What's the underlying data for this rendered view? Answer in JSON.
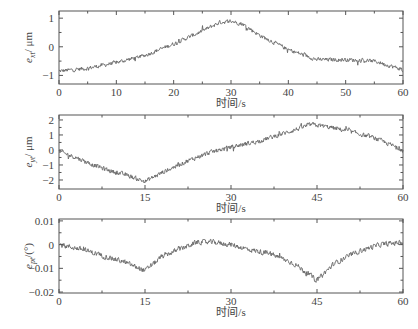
{
  "chart_data": [
    {
      "type": "line",
      "title": "",
      "xlabel": "时间/s",
      "ylabel": "e_xt / μm",
      "xlim": [
        0,
        60
      ],
      "ylim": [
        -1.3,
        1.25
      ],
      "xticks": [
        0,
        10,
        20,
        30,
        40,
        50,
        60
      ],
      "xtick_labels": [
        "0",
        "10",
        "20",
        "30",
        "40",
        "50",
        "60"
      ],
      "yticks": [
        -1,
        0,
        1
      ],
      "ytick_labels": [
        "-1",
        "0",
        "1"
      ],
      "grid": false,
      "legend": null,
      "noise_amplitude": 0.14,
      "series": [
        {
          "name": "e_xt",
          "x": [
            0,
            5,
            10,
            15,
            20,
            25,
            28,
            30,
            32,
            35,
            40,
            45,
            50,
            55,
            60
          ],
          "values": [
            -0.85,
            -0.75,
            -0.55,
            -0.3,
            0.1,
            0.55,
            0.85,
            0.9,
            0.8,
            0.4,
            -0.1,
            -0.45,
            -0.45,
            -0.5,
            -0.8
          ]
        }
      ]
    },
    {
      "type": "line",
      "title": "",
      "xlabel": "",
      "ylabel": "e_yt / μm",
      "xlim": [
        0,
        60
      ],
      "ylim": [
        -2.6,
        2.33
      ],
      "xticks": [
        0,
        15,
        30,
        45,
        60
      ],
      "xtick_labels": [
        "0",
        "15",
        "30",
        "45",
        "60"
      ],
      "yticks": [
        -2,
        -1,
        0,
        1,
        2
      ],
      "ytick_labels": [
        "-2",
        "-1",
        "0",
        "1",
        "2"
      ],
      "grid": false,
      "legend": null,
      "noise_amplitude": 0.3,
      "series": [
        {
          "name": "e_yt",
          "x": [
            0,
            3,
            6,
            9,
            12,
            15,
            18,
            22,
            26,
            30,
            35,
            40,
            44,
            46,
            50,
            55,
            60
          ],
          "values": [
            -0.1,
            -0.5,
            -1.0,
            -1.4,
            -1.7,
            -2.1,
            -1.5,
            -0.8,
            -0.2,
            0.2,
            0.6,
            1.2,
            1.7,
            1.6,
            1.3,
            0.8,
            0.0
          ]
        }
      ]
    },
    {
      "type": "line",
      "title": "",
      "xlabel": "时间/s",
      "ylabel": "e_pt / (°)",
      "xlim": [
        0,
        60
      ],
      "ylim": [
        -0.0204,
        0.0108
      ],
      "xticks": [
        0,
        15,
        30,
        45,
        60
      ],
      "xtick_labels": [
        "0",
        "15",
        "30",
        "45",
        "60"
      ],
      "yticks": [
        -0.02,
        -0.01,
        0,
        0.01
      ],
      "ytick_labels": [
        "-0.02",
        "-0.01",
        "0",
        "0.01"
      ],
      "grid": false,
      "legend": null,
      "noise_amplitude": 0.0022,
      "series": [
        {
          "name": "e_pt",
          "x": [
            0,
            4,
            8,
            11,
            15,
            18,
            21,
            24,
            27,
            30,
            33,
            37,
            41,
            45,
            48,
            52,
            56,
            60
          ],
          "values": [
            0.0,
            -0.002,
            -0.005,
            -0.007,
            -0.011,
            -0.005,
            -0.002,
            0.001,
            0.001,
            0.0,
            -0.002,
            -0.004,
            -0.008,
            -0.015,
            -0.008,
            -0.003,
            0.0,
            0.001
          ]
        }
      ]
    }
  ],
  "panels": [
    {
      "ylabel_main": "e",
      "ylabel_sub": "xt",
      "ylabel_unit": "/ μm",
      "xlabel": "时间/s"
    },
    {
      "ylabel_main": "e",
      "ylabel_sub": "yt",
      "ylabel_unit": "/ μm",
      "xlabel": "时间/s"
    },
    {
      "ylabel_main": "e",
      "ylabel_sub": "pt",
      "ylabel_unit": "/(°)",
      "xlabel": "时间/s"
    }
  ],
  "colors": {
    "trace": "#666666",
    "axes": "#555555",
    "text": "#444444",
    "background": "#ffffff"
  }
}
